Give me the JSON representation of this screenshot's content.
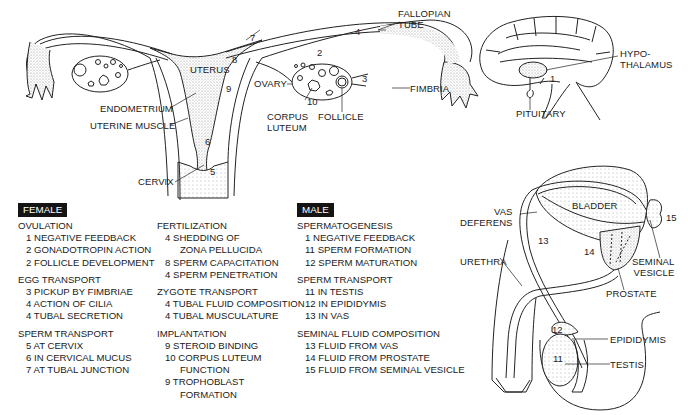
{
  "female_anatomy": {
    "labels": {
      "fallopian_tube": "FALLOPIAN\nTUBE",
      "uterus": "UTERUS",
      "endometrium": "ENDOMETRIUM",
      "uterine_muscle": "UTERINE MUSCLE",
      "cervix": "CERVIX",
      "ovary": "OVARY",
      "corpus_luteum": "CORPUS\nLUTEUM",
      "follicle": "FOLLICLE",
      "fimbria": "FIMBRIA"
    },
    "numbers": [
      "2",
      "3",
      "4",
      "5",
      "6",
      "7",
      "8",
      "9",
      "10"
    ]
  },
  "brain_anatomy": {
    "labels": {
      "hypothalamus": "HYPO-\nTHALAMUS",
      "pituitary": "PITUITARY"
    },
    "numbers": [
      "1"
    ]
  },
  "male_anatomy": {
    "labels": {
      "bladder": "BLADDER",
      "vas_deferens": "VAS\nDEFERENS",
      "urethra": "URETHRA",
      "seminal_vesicle": "SEMINAL\nVESICLE",
      "prostate": "PROSTATE",
      "epididymis": "EPIDIDYMIS",
      "testis": "TESTIS"
    },
    "numbers": [
      "11",
      "12",
      "13",
      "14",
      "15"
    ]
  },
  "female_legend": {
    "tag": "FEMALE",
    "col1": [
      {
        "title": "OVULATION",
        "items": [
          {
            "n": "1",
            "text": "NEGATIVE FEEDBACK"
          },
          {
            "n": "2",
            "text": "GONADOTROPIN ACTION"
          },
          {
            "n": "2",
            "text": "FOLLICLE DEVELOPMENT"
          }
        ]
      },
      {
        "title": "EGG TRANSPORT",
        "items": [
          {
            "n": "3",
            "text": "PICKUP BY FIMBRIAE"
          },
          {
            "n": "4",
            "text": "ACTION OF CILIA"
          },
          {
            "n": "4",
            "text": "TUBAL SECRETION"
          }
        ]
      },
      {
        "title": "SPERM TRANSPORT",
        "items": [
          {
            "n": "5",
            "text": "AT CERVIX"
          },
          {
            "n": "6",
            "text": "IN CERVICAL MUCUS"
          },
          {
            "n": "7",
            "text": "AT TUBAL JUNCTION"
          }
        ]
      }
    ],
    "col2": [
      {
        "title": "FERTILIZATION",
        "items": [
          {
            "n": "4",
            "text": "SHEDDING OF",
            "cont": "ZONA PELLUCIDA"
          },
          {
            "n": "8",
            "text": "SPERM CAPACITATION"
          },
          {
            "n": "4",
            "text": "SPERM PENETRATION"
          }
        ]
      },
      {
        "title": "ZYGOTE TRANSPORT",
        "items": [
          {
            "n": "4",
            "text": "TUBAL FLUID COMPOSITION"
          },
          {
            "n": "4",
            "text": "TUBAL MUSCULATURE"
          }
        ]
      },
      {
        "title": "IMPLANTATION",
        "items": [
          {
            "n": "9",
            "text": "STEROID BINDING"
          },
          {
            "n": "10",
            "text": "CORPUS LUTEUM",
            "cont": "FUNCTION"
          },
          {
            "n": "9",
            "text": "TROPHOBLAST",
            "cont": "FORMATION"
          }
        ]
      }
    ]
  },
  "male_legend": {
    "tag": "MALE",
    "groups": [
      {
        "title": "SPERMATOGENESIS",
        "items": [
          {
            "n": "1",
            "text": "NEGATIVE FEEDBACK"
          },
          {
            "n": "11",
            "text": "SPERM FORMATION"
          },
          {
            "n": "12",
            "text": "SPERM MATURATION"
          }
        ]
      },
      {
        "title": "SPERM TRANSPORT",
        "items": [
          {
            "n": "11",
            "text": "IN TESTIS"
          },
          {
            "n": "12",
            "text": "IN EPIDIDYMIS"
          },
          {
            "n": "13",
            "text": "IN VAS"
          }
        ]
      },
      {
        "title": "SEMINAL FLUID COMPOSITION",
        "items": [
          {
            "n": "13",
            "text": "FLUID FROM VAS"
          },
          {
            "n": "14",
            "text": "FLUID FROM PROSTATE"
          },
          {
            "n": "15",
            "text": "FLUID FROM SEMINAL VESICLE"
          }
        ]
      }
    ]
  }
}
